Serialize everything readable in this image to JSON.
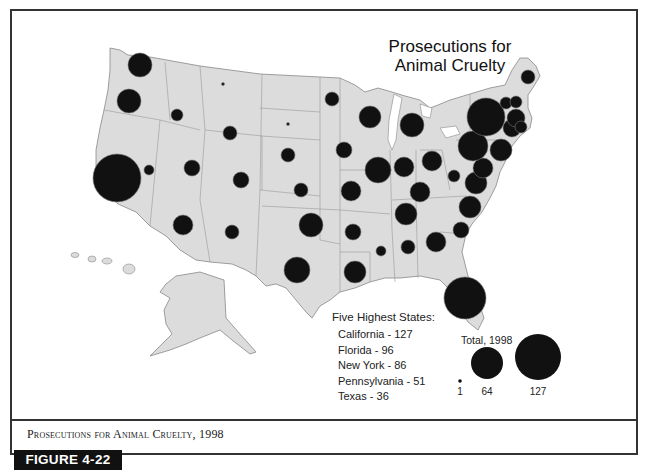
{
  "chart_data": {
    "type": "proportional-symbol-map",
    "title": "Prosecutions for Animal Cruelty",
    "caption": "Prosecutions for Animal Cruelty, 1998",
    "figure_label": "FIGURE 4-22",
    "legend": {
      "heading": "Five Highest States:",
      "top_states": [
        {
          "state": "California",
          "value": 127,
          "label": "California - 127"
        },
        {
          "state": "Florida",
          "value": 96,
          "label": "Florida - 96"
        },
        {
          "state": "New York",
          "value": 86,
          "label": "New York - 86"
        },
        {
          "state": "Pennsylvania",
          "value": 51,
          "label": "Pennsylvania - 51"
        },
        {
          "state": "Texas",
          "value": 36,
          "label": "Texas - 36"
        }
      ],
      "size_key_title": "Total, 1998",
      "size_key": [
        {
          "value": 1,
          "label": "1"
        },
        {
          "value": 64,
          "label": "64"
        },
        {
          "value": 127,
          "label": "127"
        }
      ]
    },
    "symbols": [
      {
        "state": "WA",
        "cx": 140,
        "cy": 65,
        "r": 12
      },
      {
        "state": "OR",
        "cx": 129,
        "cy": 101,
        "r": 12
      },
      {
        "state": "CA",
        "cx": 117,
        "cy": 178,
        "r": 24
      },
      {
        "state": "NV",
        "cx": 149,
        "cy": 170,
        "r": 5
      },
      {
        "state": "ID",
        "cx": 177,
        "cy": 115,
        "r": 6
      },
      {
        "state": "MT",
        "cx": 223,
        "cy": 84,
        "r": 1.5
      },
      {
        "state": "WY",
        "cx": 230,
        "cy": 133,
        "r": 7
      },
      {
        "state": "UT",
        "cx": 192,
        "cy": 168,
        "r": 8
      },
      {
        "state": "CO",
        "cx": 241,
        "cy": 180,
        "r": 8
      },
      {
        "state": "AZ",
        "cx": 183,
        "cy": 225,
        "r": 10
      },
      {
        "state": "NM",
        "cx": 232,
        "cy": 232,
        "r": 7
      },
      {
        "state": "ND",
        "cx": 288,
        "cy": 124,
        "r": 1.5
      },
      {
        "state": "SD",
        "cx": 288,
        "cy": 155,
        "r": 7
      },
      {
        "state": "NE",
        "cx": 301,
        "cy": 190,
        "r": 7
      },
      {
        "state": "KS",
        "cx": 289,
        "cy": 155,
        "r": 0
      },
      {
        "state": "OK",
        "cx": 311,
        "cy": 225,
        "r": 12
      },
      {
        "state": "TX",
        "cx": 297,
        "cy": 270,
        "r": 13
      },
      {
        "state": "MN",
        "cx": 332,
        "cy": 99,
        "r": 7
      },
      {
        "state": "IA",
        "cx": 344,
        "cy": 150,
        "r": 8
      },
      {
        "state": "MO",
        "cx": 351,
        "cy": 191,
        "r": 10
      },
      {
        "state": "AR",
        "cx": 353,
        "cy": 232,
        "r": 8
      },
      {
        "state": "LA",
        "cx": 355,
        "cy": 272,
        "r": 11
      },
      {
        "state": "WI",
        "cx": 370,
        "cy": 117,
        "r": 11
      },
      {
        "state": "IL",
        "cx": 378,
        "cy": 170,
        "r": 13
      },
      {
        "state": "MI",
        "cx": 412,
        "cy": 125,
        "r": 12
      },
      {
        "state": "IN",
        "cx": 404,
        "cy": 167,
        "r": 10
      },
      {
        "state": "OH",
        "cx": 432,
        "cy": 161,
        "r": 10
      },
      {
        "state": "KY",
        "cx": 420,
        "cy": 192,
        "r": 10
      },
      {
        "state": "TN",
        "cx": 406,
        "cy": 214,
        "r": 11
      },
      {
        "state": "MS",
        "cx": 381,
        "cy": 251,
        "r": 5
      },
      {
        "state": "AL",
        "cx": 408,
        "cy": 247,
        "r": 7
      },
      {
        "state": "GA",
        "cx": 436,
        "cy": 242,
        "r": 10
      },
      {
        "state": "FL",
        "cx": 465,
        "cy": 298,
        "r": 21
      },
      {
        "state": "SC",
        "cx": 461,
        "cy": 230,
        "r": 8
      },
      {
        "state": "NC",
        "cx": 470,
        "cy": 207,
        "r": 11
      },
      {
        "state": "VA",
        "cx": 476,
        "cy": 183,
        "r": 11
      },
      {
        "state": "WV",
        "cx": 454,
        "cy": 176,
        "r": 6
      },
      {
        "state": "MD",
        "cx": 483,
        "cy": 168,
        "r": 10
      },
      {
        "state": "PA",
        "cx": 473,
        "cy": 146,
        "r": 15
      },
      {
        "state": "NY",
        "cx": 486,
        "cy": 117,
        "r": 19
      },
      {
        "state": "NJ",
        "cx": 501,
        "cy": 150,
        "r": 11
      },
      {
        "state": "CT",
        "cx": 512,
        "cy": 128,
        "r": 9
      },
      {
        "state": "MA",
        "cx": 516,
        "cy": 118,
        "r": 9
      },
      {
        "state": "RI",
        "cx": 521,
        "cy": 127,
        "r": 6
      },
      {
        "state": "VT",
        "cx": 506,
        "cy": 103,
        "r": 6
      },
      {
        "state": "NH",
        "cx": 516,
        "cy": 102,
        "r": 6
      },
      {
        "state": "ME",
        "cx": 528,
        "cy": 77,
        "r": 7
      }
    ]
  }
}
